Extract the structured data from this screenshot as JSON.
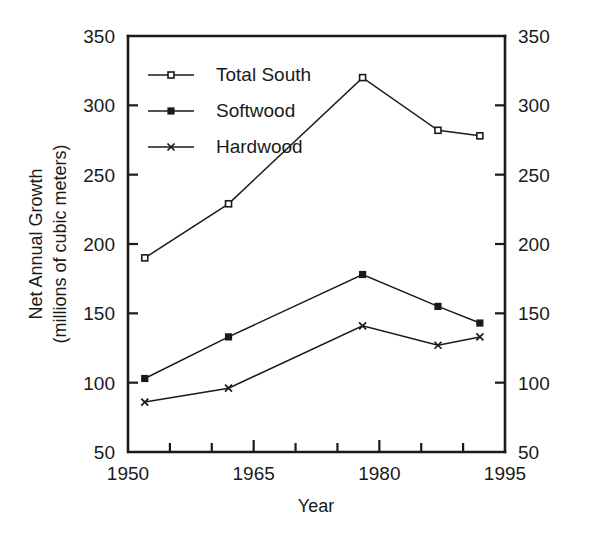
{
  "chart_data": {
    "type": "line",
    "title": "",
    "xlabel": "Year",
    "ylabel_line1": "Net Annual Growth",
    "ylabel_line2": "(millions of cubic meters)",
    "xlim": [
      1950,
      1995
    ],
    "ylim": [
      50,
      350
    ],
    "grid": false,
    "legend_position": "upper-left-inside",
    "x_ticks_major": [
      1950,
      1965,
      1980,
      1995
    ],
    "x_ticks_major_labels": [
      "1950",
      "1965",
      "1980",
      "1995"
    ],
    "x_ticks_minor": [
      1955,
      1960,
      1970,
      1975,
      1985,
      1990
    ],
    "y_ticks": [
      50,
      100,
      150,
      200,
      250,
      300,
      350
    ],
    "y_ticks_labels": [
      "50",
      "100",
      "150",
      "200",
      "250",
      "300",
      "350"
    ],
    "y_axis_right_labels": [
      "50",
      "100",
      "150",
      "200",
      "250",
      "300",
      "350"
    ],
    "x": [
      1952,
      1962,
      1978,
      1987,
      1992
    ],
    "series": [
      {
        "name": "Total South",
        "marker": "open-square",
        "values": [
          190,
          229,
          320,
          282,
          278
        ]
      },
      {
        "name": "Softwood",
        "marker": "filled-square",
        "values": [
          103,
          133,
          178,
          155,
          143
        ]
      },
      {
        "name": "Hardwood",
        "marker": "x",
        "values": [
          86,
          96,
          141,
          127,
          133
        ]
      }
    ],
    "colors": {
      "line": "#1a1a1a",
      "background": "#ffffff",
      "axis": "#1a1a1a"
    }
  },
  "legend": {
    "entries": [
      {
        "label": "Total South",
        "marker": "open-square"
      },
      {
        "label": "Softwood",
        "marker": "filled-square"
      },
      {
        "label": "Hardwood",
        "marker": "x"
      }
    ]
  }
}
